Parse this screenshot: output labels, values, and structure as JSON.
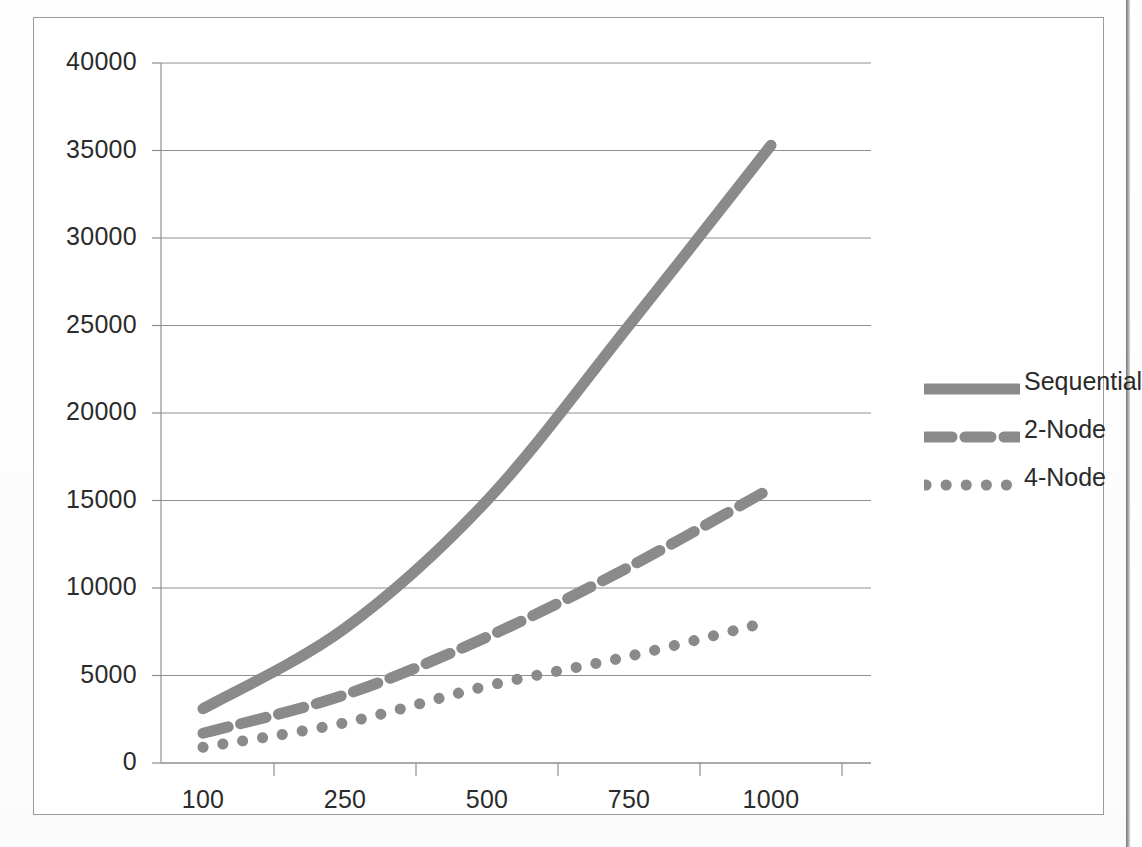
{
  "chart_data": {
    "type": "line",
    "title": "",
    "xlabel": "",
    "ylabel": "",
    "categories": [
      "100",
      "250",
      "500",
      "750",
      "1000"
    ],
    "xtick_labels": [
      "100",
      "250",
      "500",
      "750",
      "1000"
    ],
    "ytick_labels": [
      "0",
      "5000",
      "10000",
      "15000",
      "20000",
      "25000",
      "30000",
      "35000",
      "40000"
    ],
    "ytick_values": [
      0,
      5000,
      10000,
      15000,
      20000,
      25000,
      30000,
      35000,
      40000
    ],
    "ylim": [
      0,
      40000
    ],
    "grid": "horizontal",
    "legend_position": "right",
    "line_color": "#8a8a8a",
    "axis_color": "#8e8e8e",
    "series": [
      {
        "name": "Sequential",
        "style": "solid",
        "values": [
          3100,
          7700,
          15000,
          25000,
          35300
        ],
        "points": [
          {
            "x": 100,
            "y": 3100
          },
          {
            "x": 250,
            "y": 7700
          },
          {
            "x": 500,
            "y": 15000
          },
          {
            "x": 750,
            "y": 25000
          },
          {
            "x": 1000,
            "y": 35300
          }
        ]
      },
      {
        "name": "2-Node",
        "style": "dashed",
        "values": [
          1700,
          3900,
          7200,
          11200,
          15700
        ],
        "points": [
          {
            "x": 100,
            "y": 1700
          },
          {
            "x": 250,
            "y": 3900
          },
          {
            "x": 500,
            "y": 7200
          },
          {
            "x": 750,
            "y": 11200
          },
          {
            "x": 1000,
            "y": 15700
          }
        ]
      },
      {
        "name": "4-Node",
        "style": "dotted",
        "values": [
          900,
          2300,
          4400,
          6100,
          8100
        ],
        "points": [
          {
            "x": 100,
            "y": 900
          },
          {
            "x": 250,
            "y": 2300
          },
          {
            "x": 500,
            "y": 4400
          },
          {
            "x": 750,
            "y": 6100
          },
          {
            "x": 1000,
            "y": 8100
          }
        ]
      }
    ],
    "legend": [
      {
        "label": "Sequential",
        "style": "solid"
      },
      {
        "label": "2-Node",
        "style": "dashed"
      },
      {
        "label": "4-Node",
        "style": "dotted"
      }
    ]
  }
}
